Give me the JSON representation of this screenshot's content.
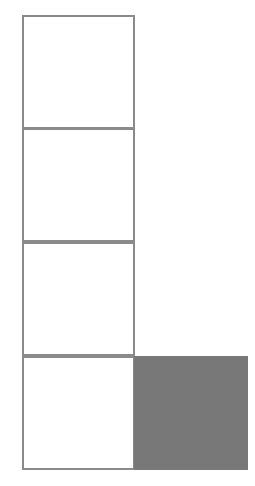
{
  "figure": {
    "canvas": {
      "width": 255,
      "height": 486,
      "background_color": "#ffffff"
    },
    "style": {
      "outline_color": "#8a8a8a",
      "outline_width": 2,
      "fill_color": "#787878",
      "empty_fill_color": "#ffffff"
    },
    "geometry": {
      "cell_size": 113.5,
      "origin_x": 22,
      "origin_y": 15,
      "columns": 2,
      "rows": 4
    },
    "counts": {
      "total_cells": 5,
      "outlined_cells": 4,
      "shaded_cells": 1
    },
    "cells": [
      {
        "id": "cell-r1c1",
        "row": 1,
        "column": 1,
        "state": "outlined",
        "fill": "#ffffff",
        "x": 22,
        "y": 15,
        "width": 113,
        "height": 114
      },
      {
        "id": "cell-r2c1",
        "row": 2,
        "column": 1,
        "state": "outlined",
        "fill": "#ffffff",
        "x": 22,
        "y": 128,
        "width": 113,
        "height": 114
      },
      {
        "id": "cell-r3c1",
        "row": 3,
        "column": 1,
        "state": "outlined",
        "fill": "#ffffff",
        "x": 22,
        "y": 242,
        "width": 113,
        "height": 114
      },
      {
        "id": "cell-r4c1",
        "row": 4,
        "column": 1,
        "state": "outlined",
        "fill": "#ffffff",
        "x": 22,
        "y": 356,
        "width": 113,
        "height": 114
      },
      {
        "id": "cell-r4c2",
        "row": 4,
        "column": 2,
        "state": "shaded",
        "fill": "#787878",
        "x": 134,
        "y": 356,
        "width": 114,
        "height": 114
      }
    ]
  }
}
